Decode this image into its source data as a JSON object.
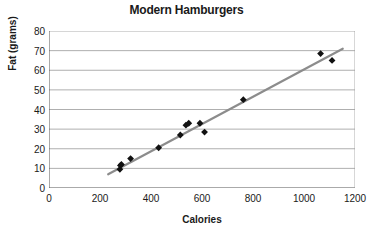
{
  "chart_data": {
    "type": "scatter",
    "title": "Modern Hamburgers",
    "xlabel": "Calories",
    "ylabel": "Fat (grams)",
    "xlim": [
      0,
      1200
    ],
    "ylim": [
      0,
      80
    ],
    "xticks": [
      0,
      200,
      400,
      600,
      800,
      1000,
      1200
    ],
    "yticks": [
      0,
      10,
      20,
      30,
      40,
      50,
      60,
      70,
      80
    ],
    "grid": "horizontal",
    "legend": "none",
    "marker": "diamond",
    "marker_color": "#111111",
    "trendline_color": "#8c8c8c",
    "points": [
      {
        "x": 278,
        "y": 9.5
      },
      {
        "x": 280,
        "y": 11.5
      },
      {
        "x": 284,
        "y": 12.0
      },
      {
        "x": 320,
        "y": 15.0
      },
      {
        "x": 430,
        "y": 20.5
      },
      {
        "x": 515,
        "y": 27.0
      },
      {
        "x": 537,
        "y": 32.0
      },
      {
        "x": 548,
        "y": 33.0
      },
      {
        "x": 592,
        "y": 33.0
      },
      {
        "x": 610,
        "y": 28.5
      },
      {
        "x": 762,
        "y": 45.0
      },
      {
        "x": 1065,
        "y": 68.5
      },
      {
        "x": 1110,
        "y": 65.0
      }
    ],
    "trendline": {
      "x0": 232,
      "y0": 7.0,
      "x1": 1152,
      "y1": 71.0
    }
  }
}
